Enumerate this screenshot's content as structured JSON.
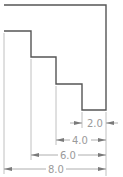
{
  "drawing": {
    "type": "stepped-profile-dimensioned",
    "colors": {
      "outline": "#555555",
      "dimension": "#9a9a9a",
      "background": "#ffffff"
    },
    "outline_points": [
      [
        4,
        5
      ],
      [
        106,
        5
      ],
      [
        106,
        110
      ],
      [
        82,
        110
      ],
      [
        82,
        84
      ],
      [
        56,
        84
      ],
      [
        56,
        57
      ],
      [
        31,
        57
      ],
      [
        31,
        31
      ],
      [
        4,
        31
      ]
    ],
    "dimensions": [
      {
        "label": "2.0",
        "from_x": 82,
        "to_x": 106,
        "y": 123,
        "style": "arrows-outside"
      },
      {
        "label": "4.0",
        "from_x": 56,
        "to_x": 106,
        "y": 140,
        "style": "arrows-inside"
      },
      {
        "label": "6.0",
        "from_x": 31,
        "to_x": 106,
        "y": 155,
        "style": "arrows-inside"
      },
      {
        "label": "8.0",
        "from_x": 4,
        "to_x": 106,
        "y": 169,
        "style": "arrows-inside"
      }
    ]
  }
}
